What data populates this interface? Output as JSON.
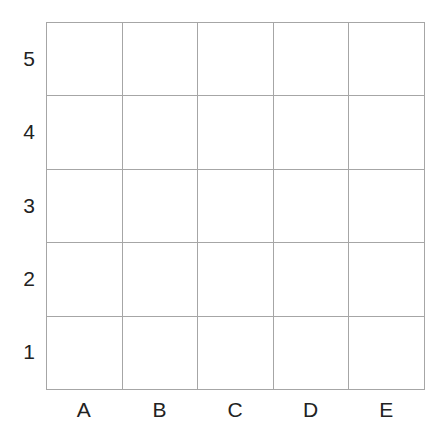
{
  "grid": {
    "columns": [
      "A",
      "B",
      "C",
      "D",
      "E"
    ],
    "rows": [
      "5",
      "4",
      "3",
      "2",
      "1"
    ],
    "line_color": "#a6a6a6",
    "label_color": "#222222",
    "cells": [
      [
        "",
        "",
        "",
        "",
        ""
      ],
      [
        "",
        "",
        "",
        "",
        ""
      ],
      [
        "",
        "",
        "",
        "",
        ""
      ],
      [
        "",
        "",
        "",
        "",
        ""
      ],
      [
        "",
        "",
        "",
        "",
        ""
      ]
    ]
  }
}
